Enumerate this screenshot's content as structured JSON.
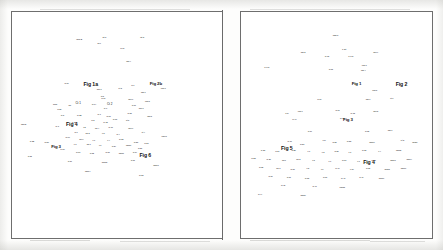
{
  "document": {
    "kind": "scanned-journal-spread",
    "page_background": "#fdfdfc",
    "ink_color": "#111111",
    "frame_color": "#6e6e6e"
  },
  "panels": [
    {
      "id": "left",
      "name": "left-plot-panel",
      "x": 11,
      "y": 11,
      "w": 212,
      "h": 228
    },
    {
      "id": "right",
      "name": "right-plot-panel",
      "x": 240,
      "y": 11,
      "w": 193,
      "h": 228
    }
  ],
  "chart_data": [
    {
      "type": "scatter",
      "title": "",
      "xlabel": "",
      "ylabel": "",
      "grid": false,
      "legend": null,
      "axis_visible": false,
      "note": "Left panel: dense label cloud, points rendered as tiny text labels. Coordinates are panel-relative percentages.",
      "figure_labels": [
        {
          "text": "Fig 1a",
          "x": 37.5,
          "y": 32.5
        },
        {
          "text": "Fig 2b",
          "x": 68.5,
          "y": 32.0
        },
        {
          "text": "Fig 4",
          "x": 28.5,
          "y": 49.8
        },
        {
          "text": "Fig 3",
          "x": 21.0,
          "y": 59.8
        },
        {
          "text": "Fig 6",
          "x": 63.5,
          "y": 63.5
        }
      ],
      "points": [
        {
          "t": "obs 2",
          "x": 32.0,
          "y": 12.5,
          "s": "s"
        },
        {
          "t": "pt 1",
          "x": 44.0,
          "y": 11.5,
          "s": "s"
        },
        {
          "t": "fig 0",
          "x": 41.5,
          "y": 13.8,
          "s": "t"
        },
        {
          "t": "pt 3",
          "x": 62.0,
          "y": 11.5,
          "s": "s"
        },
        {
          "t": "fo es",
          "x": 52.5,
          "y": 15.8,
          "s": "t"
        },
        {
          "t": "obs 4",
          "x": 55.5,
          "y": 21.5,
          "s": "t"
        },
        {
          "t": "fo 16",
          "x": 26.0,
          "y": 31.5,
          "s": "t"
        },
        {
          "t": "obs 1",
          "x": 41.5,
          "y": 34.0,
          "s": "t"
        },
        {
          "t": "fo 8",
          "x": 43.0,
          "y": 37.0,
          "s": "t"
        },
        {
          "t": "pt 2",
          "x": 51.5,
          "y": 33.5,
          "s": "t"
        },
        {
          "t": "fo 9",
          "x": 57.5,
          "y": 32.5,
          "s": "t"
        },
        {
          "t": "obs 3",
          "x": 72.0,
          "y": 33.5,
          "s": "t"
        },
        {
          "t": "obs 7",
          "x": 62.5,
          "y": 35.5,
          "s": "t"
        },
        {
          "t": "fresh",
          "x": 20.5,
          "y": 40.5,
          "s": "t"
        },
        {
          "t": "fo 20",
          "x": 22.5,
          "y": 42.8,
          "s": "t"
        },
        {
          "t": "wk",
          "x": 27.5,
          "y": 41.0,
          "s": "t"
        },
        {
          "t": "Ct 1",
          "x": 31.5,
          "y": 40.2,
          "s": "m"
        },
        {
          "t": "fo 14",
          "x": 39.0,
          "y": 40.5,
          "s": "t"
        },
        {
          "t": "Ct 2",
          "x": 46.5,
          "y": 40.5,
          "s": "m"
        },
        {
          "t": "fo 19",
          "x": 43.5,
          "y": 38.0,
          "s": "t"
        },
        {
          "t": "fo 6",
          "x": 44.5,
          "y": 42.5,
          "s": "t"
        },
        {
          "t": "obs 9",
          "x": 56.5,
          "y": 38.5,
          "s": "t"
        },
        {
          "t": "fo 11",
          "x": 58.0,
          "y": 41.0,
          "s": "t"
        },
        {
          "t": "obs 5",
          "x": 64.5,
          "y": 39.5,
          "s": "t"
        },
        {
          "t": "obs 6",
          "x": 61.5,
          "y": 42.5,
          "s": "t"
        },
        {
          "t": "fo 18",
          "x": 56.0,
          "y": 44.5,
          "s": "t"
        },
        {
          "t": "fo 5",
          "x": 24.0,
          "y": 45.5,
          "s": "t"
        },
        {
          "t": "fo 22",
          "x": 32.0,
          "y": 45.5,
          "s": "t"
        },
        {
          "t": "fo 7",
          "x": 41.5,
          "y": 45.0,
          "s": "t"
        },
        {
          "t": "fo 13",
          "x": 46.0,
          "y": 46.0,
          "s": "t"
        },
        {
          "t": "obs 8",
          "x": 65.5,
          "y": 46.0,
          "s": "t"
        },
        {
          "t": "fo 21",
          "x": 29.5,
          "y": 48.5,
          "s": "t"
        },
        {
          "t": "fo 2",
          "x": 38.5,
          "y": 48.0,
          "s": "t"
        },
        {
          "t": "fo 12",
          "x": 44.5,
          "y": 48.5,
          "s": "t"
        },
        {
          "t": "fo 15",
          "x": 49.0,
          "y": 47.5,
          "s": "t"
        },
        {
          "t": "pt 5",
          "x": 55.0,
          "y": 48.0,
          "s": "t"
        },
        {
          "t": "obs42",
          "x": 5.5,
          "y": 49.5,
          "s": "t"
        },
        {
          "t": "fo 3",
          "x": 21.5,
          "y": 50.5,
          "s": "t"
        },
        {
          "t": "c 2",
          "x": 34.5,
          "y": 51.0,
          "s": "t"
        },
        {
          "t": "wk 4",
          "x": 40.5,
          "y": 51.5,
          "s": "t"
        },
        {
          "t": "fo 17",
          "x": 47.0,
          "y": 51.0,
          "s": "t"
        },
        {
          "t": "obs 0",
          "x": 56.5,
          "y": 51.5,
          "s": "t"
        },
        {
          "t": "fo 1",
          "x": 30.5,
          "y": 53.0,
          "s": "t"
        },
        {
          "t": "wk 2",
          "x": 36.0,
          "y": 53.5,
          "s": "t"
        },
        {
          "t": "c 5",
          "x": 43.5,
          "y": 53.5,
          "s": "t"
        },
        {
          "t": "fo 4",
          "x": 50.5,
          "y": 54.0,
          "s": "t"
        },
        {
          "t": "pt 4",
          "x": 62.5,
          "y": 53.0,
          "s": "t"
        },
        {
          "t": "fo 10",
          "x": 26.5,
          "y": 55.5,
          "s": "t"
        },
        {
          "t": "wk 1",
          "x": 33.0,
          "y": 56.0,
          "s": "t"
        },
        {
          "t": "c 1",
          "x": 39.0,
          "y": 56.5,
          "s": "t"
        },
        {
          "t": "c 4",
          "x": 46.0,
          "y": 56.5,
          "s": "t"
        },
        {
          "t": "fo 23",
          "x": 52.0,
          "y": 56.0,
          "s": "t"
        },
        {
          "t": "obs41",
          "x": 72.5,
          "y": 55.0,
          "s": "t"
        },
        {
          "t": "fo 25",
          "x": 59.0,
          "y": 57.5,
          "s": "t"
        },
        {
          "t": "c 3",
          "x": 30.0,
          "y": 58.5,
          "s": "t"
        },
        {
          "t": "wk 3",
          "x": 36.5,
          "y": 58.5,
          "s": "t"
        },
        {
          "t": "c 6",
          "x": 42.0,
          "y": 59.0,
          "s": "t"
        },
        {
          "t": "fo 24",
          "x": 48.5,
          "y": 59.5,
          "s": "t"
        },
        {
          "t": "obs10",
          "x": 55.5,
          "y": 59.0,
          "s": "t"
        },
        {
          "t": "fo 26",
          "x": 61.0,
          "y": 60.0,
          "s": "t"
        },
        {
          "t": "fo 27",
          "x": 64.0,
          "y": 58.0,
          "s": "t"
        },
        {
          "t": "fo 28",
          "x": 9.5,
          "y": 57.0,
          "s": "t"
        },
        {
          "t": "fo 29",
          "x": 16.5,
          "y": 57.5,
          "s": "t"
        },
        {
          "t": "fo 30",
          "x": 24.0,
          "y": 60.5,
          "s": "t"
        },
        {
          "t": "fo 31",
          "x": 31.5,
          "y": 62.0,
          "s": "t"
        },
        {
          "t": "fo 32",
          "x": 38.0,
          "y": 62.5,
          "s": "t"
        },
        {
          "t": "fo 33",
          "x": 45.5,
          "y": 62.0,
          "s": "t"
        },
        {
          "t": "obs11",
          "x": 52.0,
          "y": 62.5,
          "s": "t"
        },
        {
          "t": "fo 34",
          "x": 58.5,
          "y": 62.0,
          "s": "t"
        },
        {
          "t": "fo 35",
          "x": 8.5,
          "y": 63.5,
          "s": "t"
        },
        {
          "t": "fo 36",
          "x": 27.5,
          "y": 66.0,
          "s": "t"
        },
        {
          "t": "obs12",
          "x": 44.0,
          "y": 66.5,
          "s": "t"
        },
        {
          "t": "fo 37",
          "x": 57.5,
          "y": 65.5,
          "s": "t"
        },
        {
          "t": "obs13",
          "x": 68.5,
          "y": 67.5,
          "s": "t"
        },
        {
          "t": "obs14",
          "x": 36.0,
          "y": 70.5,
          "s": "t"
        },
        {
          "t": "fo 38",
          "x": 61.5,
          "y": 72.0,
          "s": "t"
        },
        {
          "t": "·",
          "x": 45.0,
          "y": 76.5,
          "s": "t"
        }
      ]
    },
    {
      "type": "scatter",
      "title": "",
      "xlabel": "",
      "ylabel": "",
      "grid": false,
      "legend": null,
      "axis_visible": false,
      "note": "Right panel: dense label cloud with figure callouts. Coordinates are panel-relative percentages.",
      "figure_labels": [
        {
          "text": "Fig 2",
          "x": 84.0,
          "y": 32.5
        },
        {
          "text": "Fig 1",
          "x": 60.5,
          "y": 32.0
        },
        {
          "text": "Fig 5",
          "x": 24.0,
          "y": 60.5
        },
        {
          "text": "Fig 3",
          "x": 56.0,
          "y": 48.0
        },
        {
          "text": "Fig 4",
          "x": 67.0,
          "y": 67.0
        }
      ],
      "points": [
        {
          "t": "obs 1",
          "x": 49.5,
          "y": 10.5,
          "s": "s"
        },
        {
          "t": "obs 2",
          "x": 32.5,
          "y": 17.5,
          "s": "t"
        },
        {
          "t": "1 cat",
          "x": 54.0,
          "y": 16.5,
          "s": "t"
        },
        {
          "t": "obs e",
          "x": 70.5,
          "y": 17.5,
          "s": "t"
        },
        {
          "t": "fo 05",
          "x": 45.0,
          "y": 19.5,
          "s": "t"
        },
        {
          "t": "1 c 06",
          "x": 57.5,
          "y": 19.5,
          "s": "t"
        },
        {
          "t": "1 c 06",
          "x": 13.5,
          "y": 24.5,
          "s": "t"
        },
        {
          "t": "fo 08",
          "x": 47.0,
          "y": 25.0,
          "s": "t"
        },
        {
          "t": "obs 3",
          "x": 64.5,
          "y": 23.5,
          "s": "t"
        },
        {
          "t": "obs 4",
          "x": 64.0,
          "y": 25.5,
          "s": "t"
        },
        {
          "t": "obs 5",
          "x": 70.0,
          "y": 34.5,
          "s": "t"
        },
        {
          "t": "fo 10",
          "x": 41.0,
          "y": 38.5,
          "s": "t"
        },
        {
          "t": "obs 6",
          "x": 66.5,
          "y": 38.5,
          "s": "t"
        },
        {
          "t": "pt 1",
          "x": 79.0,
          "y": 38.0,
          "s": "t"
        },
        {
          "t": "1 m",
          "x": 24.0,
          "y": 44.5,
          "s": "t"
        },
        {
          "t": "obs 7",
          "x": 31.0,
          "y": 44.0,
          "s": "t"
        },
        {
          "t": "fo 11",
          "x": 50.5,
          "y": 43.5,
          "s": "t"
        },
        {
          "t": "fo 12",
          "x": 58.5,
          "y": 44.5,
          "s": "t"
        },
        {
          "t": "obs 8",
          "x": 70.5,
          "y": 44.0,
          "s": "t"
        },
        {
          "t": "fo 14",
          "x": 28.0,
          "y": 47.5,
          "s": "t"
        },
        {
          "t": "fo 13",
          "x": 53.0,
          "y": 47.0,
          "s": "t"
        },
        {
          "t": "fo 16",
          "x": 36.0,
          "y": 52.5,
          "s": "t"
        },
        {
          "t": "fo 18",
          "x": 66.0,
          "y": 52.5,
          "s": "t"
        },
        {
          "t": "obs 9",
          "x": 78.0,
          "y": 52.0,
          "s": "t"
        },
        {
          "t": "fo 19",
          "x": 25.5,
          "y": 57.0,
          "s": "t"
        },
        {
          "t": "fo 20",
          "x": 32.0,
          "y": 58.5,
          "s": "t"
        },
        {
          "t": "1 fo",
          "x": 43.5,
          "y": 56.5,
          "s": "t"
        },
        {
          "t": "fo 21",
          "x": 49.0,
          "y": 57.5,
          "s": "t"
        },
        {
          "t": "fo 22",
          "x": 56.5,
          "y": 57.0,
          "s": "t"
        },
        {
          "t": "obs10",
          "x": 68.5,
          "y": 57.5,
          "s": "t"
        },
        {
          "t": "pt 2",
          "x": 84.5,
          "y": 56.5,
          "s": "t"
        },
        {
          "t": "obs11",
          "x": 91.0,
          "y": 57.5,
          "s": "t"
        },
        {
          "t": "fo 23",
          "x": 11.5,
          "y": 61.0,
          "s": "t"
        },
        {
          "t": "fo 24",
          "x": 19.0,
          "y": 61.5,
          "s": "t"
        },
        {
          "t": "fo 25",
          "x": 27.5,
          "y": 61.0,
          "s": "t"
        },
        {
          "t": "c 1",
          "x": 35.5,
          "y": 61.5,
          "s": "t"
        },
        {
          "t": "c 2",
          "x": 43.0,
          "y": 62.0,
          "s": "t"
        },
        {
          "t": "fo 26",
          "x": 50.0,
          "y": 61.5,
          "s": "t"
        },
        {
          "t": "c 3",
          "x": 57.0,
          "y": 62.0,
          "s": "t"
        },
        {
          "t": "fo 27",
          "x": 64.5,
          "y": 61.0,
          "s": "t"
        },
        {
          "t": "c 4",
          "x": 72.5,
          "y": 61.5,
          "s": "t"
        },
        {
          "t": "obs12",
          "x": 82.5,
          "y": 61.0,
          "s": "t"
        },
        {
          "t": "fo 28",
          "x": 6.5,
          "y": 64.5,
          "s": "t"
        },
        {
          "t": "fo 29",
          "x": 14.5,
          "y": 65.0,
          "s": "t"
        },
        {
          "t": "wk 1",
          "x": 22.5,
          "y": 65.5,
          "s": "t"
        },
        {
          "t": "wk 2",
          "x": 30.0,
          "y": 65.0,
          "s": "t"
        },
        {
          "t": "c 5",
          "x": 38.0,
          "y": 65.5,
          "s": "t"
        },
        {
          "t": "c 6",
          "x": 46.5,
          "y": 66.0,
          "s": "t"
        },
        {
          "t": "fo 30",
          "x": 54.0,
          "y": 65.5,
          "s": "t"
        },
        {
          "t": "c 7",
          "x": 61.5,
          "y": 66.0,
          "s": "t"
        },
        {
          "t": "fo 31",
          "x": 69.5,
          "y": 65.5,
          "s": "t"
        },
        {
          "t": "obs13",
          "x": 79.5,
          "y": 65.5,
          "s": "t"
        },
        {
          "t": "obs14",
          "x": 88.0,
          "y": 65.0,
          "s": "t"
        },
        {
          "t": "fo 32",
          "x": 10.5,
          "y": 68.5,
          "s": "t"
        },
        {
          "t": "wk 3",
          "x": 19.5,
          "y": 69.0,
          "s": "t"
        },
        {
          "t": "fo 33",
          "x": 27.0,
          "y": 69.5,
          "s": "t"
        },
        {
          "t": "c 8",
          "x": 35.0,
          "y": 69.0,
          "s": "t"
        },
        {
          "t": "c 9",
          "x": 42.5,
          "y": 69.5,
          "s": "t"
        },
        {
          "t": "fo 34",
          "x": 50.5,
          "y": 69.0,
          "s": "t"
        },
        {
          "t": "c 10",
          "x": 58.0,
          "y": 69.5,
          "s": "t"
        },
        {
          "t": "fo 35",
          "x": 66.5,
          "y": 69.0,
          "s": "t"
        },
        {
          "t": "obs15",
          "x": 76.5,
          "y": 69.5,
          "s": "t"
        },
        {
          "t": "obs16",
          "x": 85.0,
          "y": 69.0,
          "s": "t"
        },
        {
          "t": "fo 36",
          "x": 15.5,
          "y": 72.5,
          "s": "t"
        },
        {
          "t": "fo 37",
          "x": 25.0,
          "y": 73.0,
          "s": "t"
        },
        {
          "t": "fo 38",
          "x": 34.5,
          "y": 73.5,
          "s": "t"
        },
        {
          "t": "fo 39",
          "x": 44.0,
          "y": 73.0,
          "s": "t"
        },
        {
          "t": "fo 40",
          "x": 53.5,
          "y": 73.5,
          "s": "t"
        },
        {
          "t": "fo 41",
          "x": 63.0,
          "y": 73.0,
          "s": "t"
        },
        {
          "t": "obs17",
          "x": 73.5,
          "y": 73.5,
          "s": "t"
        },
        {
          "t": "fo 42",
          "x": 22.0,
          "y": 76.5,
          "s": "t"
        },
        {
          "t": "fo 43",
          "x": 38.5,
          "y": 77.0,
          "s": "t"
        },
        {
          "t": "obs18",
          "x": 53.0,
          "y": 77.5,
          "s": "t"
        },
        {
          "t": "fo 44",
          "x": 10.0,
          "y": 80.5,
          "s": "t"
        },
        {
          "t": "obs19",
          "x": 32.5,
          "y": 81.0,
          "s": "t"
        }
      ]
    }
  ]
}
